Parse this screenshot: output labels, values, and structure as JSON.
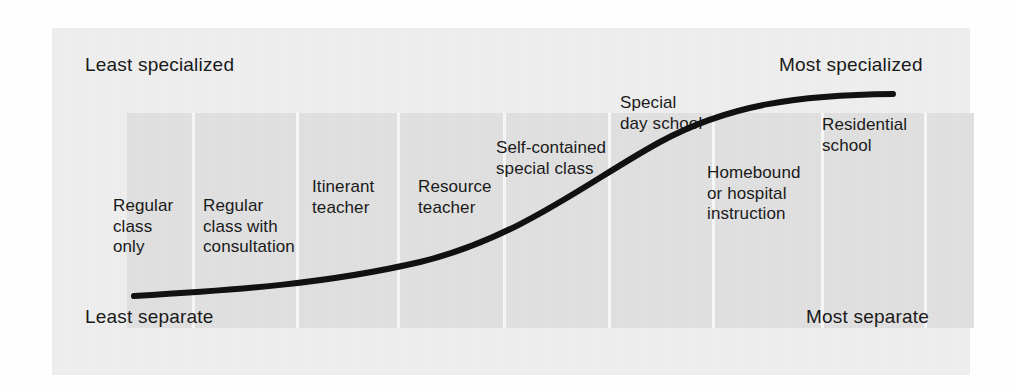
{
  "figure": {
    "type": "continuum-diagram",
    "corner_labels": {
      "top_left": "Least specialized",
      "top_right": "Most specialized",
      "bottom_left": "Least separate",
      "bottom_right": "Most separate"
    },
    "colors": {
      "page_background": "#ffffff",
      "outer_panel": "#eeeeee",
      "inner_band": "#e0e0e0",
      "divider": "#f7f7f7",
      "curve": "#111111",
      "text": "#1a1a1a"
    },
    "placements": [
      {
        "label": "Regular\nclass\nonly",
        "x": 113,
        "y": 196
      },
      {
        "label": "Regular\nclass with\nconsultation",
        "x": 203,
        "y": 196
      },
      {
        "label": "Itinerant\nteacher",
        "x": 312,
        "y": 177
      },
      {
        "label": "Resource\nteacher",
        "x": 418,
        "y": 177
      },
      {
        "label": "Self-contained\nspecial class",
        "x": 496,
        "y": 138
      },
      {
        "label": "Special\nday school",
        "x": 620,
        "y": 93
      },
      {
        "label": "Homebound\nor hospital\ninstruction",
        "x": 707,
        "y": 163
      },
      {
        "label": "Residential\nschool",
        "x": 822,
        "y": 115
      }
    ],
    "dividers_x": [
      140,
      244,
      345,
      451,
      556,
      660,
      769,
      872
    ],
    "curve": {
      "description": "S-shaped curve rising from least separate / least specialized at lower left to most separate / most specialized at upper right",
      "path": "M 134 296 C 240 290, 330 283, 420 262 C 520 238, 590 180, 660 142 C 730 104, 800 95, 893 94",
      "stroke_width": 6
    }
  }
}
